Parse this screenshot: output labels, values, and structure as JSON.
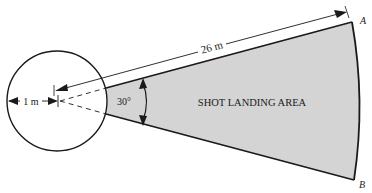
{
  "diagram": {
    "area_label": "SHOT LANDING AREA",
    "length_label": "26 m",
    "radius_label": "1 m",
    "angle_label": "30°",
    "point_a": "A",
    "point_b": "B",
    "colors": {
      "sector_fill": "#d4d4d4",
      "stroke": "#1a1a1a",
      "background": "#ffffff"
    }
  }
}
